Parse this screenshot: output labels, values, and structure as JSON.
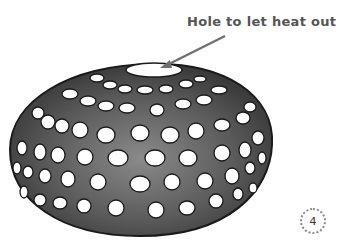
{
  "illustration": {
    "subject": "perforated dome oven",
    "callout": {
      "text": "Hole to let heat out"
    },
    "colors": {
      "dome_dark": "#3a3a3a",
      "dome_mid": "#6e6e6e",
      "outline": "#1a1a1a",
      "hole": "#ffffff",
      "arrow": "#707070",
      "label": "#555555"
    }
  },
  "page": {
    "number": "4"
  }
}
